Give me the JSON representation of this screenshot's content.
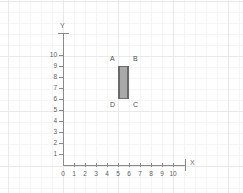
{
  "figure": {
    "title": "",
    "x_axis_name": "X",
    "y_axis_name": "Y",
    "x_ticks": [
      "0",
      "1",
      "2",
      "3",
      "4",
      "5",
      "6",
      "7",
      "8",
      "9",
      "10"
    ],
    "y_ticks": [
      "1",
      "2",
      "3",
      "4",
      "5",
      "6",
      "7",
      "8",
      "9",
      "10"
    ],
    "origin_label": "0",
    "colors": {
      "fill": "#a9a9a9",
      "stroke": "#6b6b6b",
      "axis": "#8a8a8a",
      "grid_minor": "#f5f5f5",
      "grid_major": "#e9e9e9",
      "label_text": "#4f4f4f"
    },
    "vertices": [
      {
        "label": "A",
        "x": 5,
        "y": 9
      },
      {
        "label": "B",
        "x": 6,
        "y": 9
      },
      {
        "label": "C",
        "x": 6,
        "y": 6
      },
      {
        "label": "D",
        "x": 5,
        "y": 6
      }
    ]
  },
  "chart_data": {
    "type": "scatter",
    "title": "",
    "xlabel": "X",
    "ylabel": "Y",
    "xlim": [
      0,
      11
    ],
    "ylim": [
      0,
      11
    ],
    "grid": true,
    "legend": "none",
    "x_tick_labels": [
      "0",
      "1",
      "2",
      "3",
      "4",
      "5",
      "6",
      "7",
      "8",
      "9",
      "10"
    ],
    "y_tick_labels": [
      "0",
      "1",
      "2",
      "3",
      "4",
      "5",
      "6",
      "7",
      "8",
      "9",
      "10"
    ],
    "annotations": [
      "A",
      "B",
      "C",
      "D"
    ],
    "series": [
      {
        "name": "rectangle ABCD",
        "shape": "rectangle",
        "points": [
          {
            "label": "A",
            "x": 5,
            "y": 9
          },
          {
            "label": "B",
            "x": 6,
            "y": 9
          },
          {
            "label": "C",
            "x": 6,
            "y": 6
          },
          {
            "label": "D",
            "x": 5,
            "y": 6
          }
        ],
        "width": 1,
        "height": 3,
        "area": 3,
        "perimeter": 8,
        "fill": "#a9a9a9",
        "stroke": "#6b6b6b"
      }
    ]
  }
}
